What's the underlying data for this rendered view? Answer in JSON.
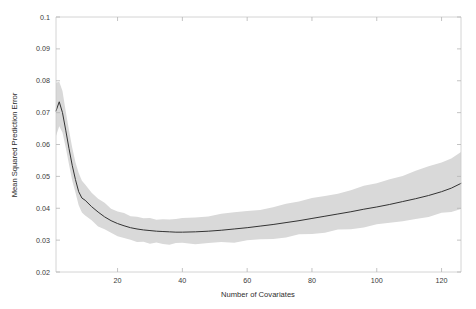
{
  "chart_data": {
    "type": "line",
    "title": "",
    "xlabel": "Number of Covariates",
    "ylabel": "Mean Squared Prediction Error",
    "xlim": [
      1,
      126
    ],
    "ylim": [
      0.02,
      0.1
    ],
    "grid": false,
    "legend": "none",
    "xticks": [
      20,
      40,
      60,
      80,
      100,
      120
    ],
    "xtick_labels": [
      "20",
      "40",
      "60",
      "80",
      "100",
      "120"
    ],
    "yticks": [
      0.02,
      0.03,
      0.04,
      0.05,
      0.06,
      0.07,
      0.08,
      0.09,
      0.1
    ],
    "ytick_labels": [
      "0.02",
      "0.03",
      "0.04",
      "0.05",
      "0.06",
      "0.07",
      "0.08",
      "0.09",
      "0.1"
    ],
    "colors": {
      "line": "#333333",
      "band": "#d9d9d9",
      "axis": "#c9c9c9",
      "background": "#ffffff"
    },
    "series": [
      {
        "name": "Mean Squared Prediction Error",
        "style": "line",
        "x": [
          1,
          2,
          3,
          4,
          5,
          6,
          7,
          8,
          9,
          10,
          12,
          14,
          16,
          18,
          20,
          22,
          24,
          26,
          28,
          30,
          32,
          34,
          36,
          38,
          40,
          44,
          48,
          52,
          56,
          60,
          64,
          68,
          72,
          76,
          80,
          84,
          88,
          92,
          96,
          100,
          104,
          108,
          112,
          116,
          120,
          123,
          126
        ],
        "values": [
          0.0705,
          0.0734,
          0.07,
          0.0645,
          0.0588,
          0.0535,
          0.049,
          0.0452,
          0.0432,
          0.0425,
          0.0405,
          0.0388,
          0.0373,
          0.0361,
          0.0352,
          0.0345,
          0.0339,
          0.0335,
          0.0332,
          0.033,
          0.0328,
          0.0327,
          0.0326,
          0.0325,
          0.0325,
          0.0326,
          0.0328,
          0.0331,
          0.0335,
          0.0339,
          0.0344,
          0.0349,
          0.0355,
          0.0361,
          0.0368,
          0.0375,
          0.0382,
          0.0389,
          0.0397,
          0.0404,
          0.0412,
          0.0421,
          0.043,
          0.044,
          0.0452,
          0.0463,
          0.0478
        ]
      },
      {
        "name": "upper band",
        "style": "band-upper",
        "x": [
          1,
          2,
          3,
          4,
          5,
          6,
          7,
          8,
          9,
          10,
          12,
          14,
          16,
          18,
          20,
          22,
          24,
          26,
          28,
          30,
          32,
          34,
          36,
          38,
          40,
          44,
          48,
          52,
          56,
          60,
          64,
          68,
          72,
          76,
          80,
          84,
          88,
          92,
          96,
          100,
          104,
          108,
          112,
          116,
          120,
          123,
          126
        ],
        "values": [
          0.079,
          0.08,
          0.0765,
          0.0705,
          0.0645,
          0.059,
          0.0545,
          0.0508,
          0.0485,
          0.0475,
          0.0452,
          0.0432,
          0.0415,
          0.0402,
          0.0392,
          0.0385,
          0.0378,
          0.0373,
          0.037,
          0.0368,
          0.0366,
          0.0366,
          0.0366,
          0.0366,
          0.0367,
          0.037,
          0.0374,
          0.0379,
          0.0385,
          0.0391,
          0.0398,
          0.0405,
          0.0413,
          0.0421,
          0.043,
          0.0439,
          0.0449,
          0.0459,
          0.047,
          0.048,
          0.0492,
          0.0504,
          0.0517,
          0.053,
          0.0545,
          0.0558,
          0.0575
        ]
      },
      {
        "name": "lower band",
        "style": "band-lower",
        "x": [
          1,
          2,
          3,
          4,
          5,
          6,
          7,
          8,
          9,
          10,
          12,
          14,
          16,
          18,
          20,
          22,
          24,
          26,
          28,
          30,
          32,
          34,
          36,
          38,
          40,
          44,
          48,
          52,
          56,
          60,
          64,
          68,
          72,
          76,
          80,
          84,
          88,
          92,
          96,
          100,
          104,
          108,
          112,
          116,
          120,
          123,
          126
        ],
        "values": [
          0.0625,
          0.066,
          0.0635,
          0.0588,
          0.0538,
          0.049,
          0.0448,
          0.041,
          0.0388,
          0.038,
          0.036,
          0.0344,
          0.0331,
          0.032,
          0.0312,
          0.0306,
          0.0301,
          0.0297,
          0.0294,
          0.0292,
          0.0291,
          0.029,
          0.0289,
          0.0288,
          0.0288,
          0.0289,
          0.029,
          0.0292,
          0.0295,
          0.0298,
          0.0302,
          0.0306,
          0.031,
          0.0315,
          0.032,
          0.0325,
          0.0331,
          0.0336,
          0.0342,
          0.0348,
          0.0354,
          0.0361,
          0.0368,
          0.0375,
          0.0383,
          0.039,
          0.04
        ]
      }
    ]
  }
}
